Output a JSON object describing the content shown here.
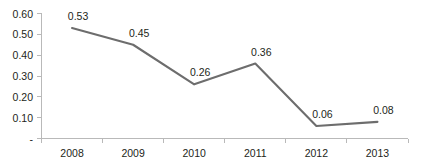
{
  "chart_data": {
    "type": "line",
    "title": "",
    "subtitle": "",
    "xlabel": "",
    "ylabel": "",
    "categories": [
      "2008",
      "2009",
      "2010",
      "2011",
      "2012",
      "2013"
    ],
    "values": [
      0.53,
      0.45,
      0.26,
      0.36,
      0.06,
      0.08
    ],
    "data_labels": [
      "0.53",
      "0.45",
      "0.26",
      "0.36",
      "0.06",
      "0.08"
    ],
    "series": [
      {
        "name": "",
        "values": [
          0.53,
          0.45,
          0.26,
          0.36,
          0.06,
          0.08
        ],
        "color": "#6d6d6d"
      }
    ],
    "ylim": [
      0,
      0.6
    ],
    "y_ticks": [
      0,
      0.1,
      0.2,
      0.3,
      0.4,
      0.5,
      0.6
    ],
    "y_tick_labels": [
      "-",
      "0.10",
      "0.20",
      "0.30",
      "0.40",
      "0.50",
      "0.60"
    ],
    "x_tick_labels": [
      "2008",
      "2009",
      "2010",
      "2011",
      "2012",
      "2013"
    ],
    "grid": false,
    "legend": false,
    "legend_position": "none",
    "axis_color": "#b9b9b9",
    "text_color": "#231f20",
    "background_color": "#ffffff"
  }
}
